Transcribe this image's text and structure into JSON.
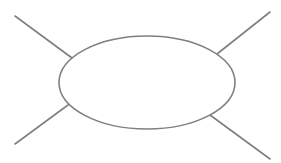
{
  "diagram": {
    "type": "spider-diagram",
    "background": "#ffffff",
    "stroke_color": "#7f7f7f",
    "stroke_width": 1.6,
    "center_shape": {
      "shape": "ellipse",
      "cx": 147,
      "cy": 82.5,
      "rx": 88,
      "ry": 46.5,
      "label": ""
    },
    "legs": [
      {
        "id": "top-left",
        "x1": 72,
        "y1": 58,
        "x2": 15,
        "y2": 16
      },
      {
        "id": "top-right",
        "x1": 217,
        "y1": 54,
        "x2": 270,
        "y2": 12
      },
      {
        "id": "bottom-left",
        "x1": 68,
        "y1": 105,
        "x2": 15,
        "y2": 144
      },
      {
        "id": "bottom-right",
        "x1": 210,
        "y1": 115,
        "x2": 270,
        "y2": 159
      }
    ]
  }
}
